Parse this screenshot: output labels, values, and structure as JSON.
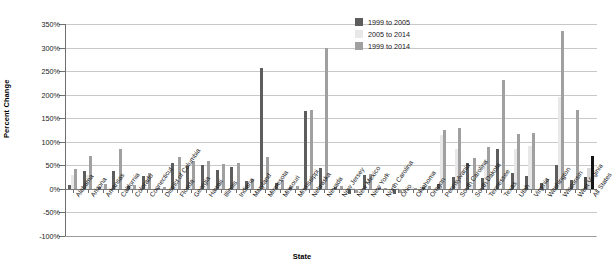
{
  "chart_data": {
    "type": "bar",
    "title": "",
    "xlabel": "State",
    "ylabel": "Percent Change",
    "ylim": [
      -100,
      350
    ],
    "ytick_step": 50,
    "ytick_labels": [
      "350%",
      "300%",
      "250%",
      "200%",
      "150%",
      "100%",
      "50%",
      "0%",
      "-50%",
      "-100%"
    ],
    "ytick_values": [
      350,
      300,
      250,
      200,
      150,
      100,
      50,
      0,
      -50,
      -100
    ],
    "grid": true,
    "legend_position": "top-right",
    "colors": {
      "series0": "#5d5d5d",
      "series1": "#e8e8e8",
      "series2": "#a0a0a0",
      "all_states_accent": "#151515"
    },
    "legend": [
      "1999 to 2005",
      "2005 to 2014",
      "1999 to 2014"
    ],
    "categories": [
      "Alabama",
      "Arizona",
      "Arkansas",
      "California",
      "Colorado",
      "Connecticut",
      "District of Columbia",
      "Florida",
      "Georgia",
      "Hawaii",
      "Illinois",
      "Indiana",
      "Maryland",
      "Minnesota",
      "Missouri",
      "Mississippi",
      "Nebraska",
      "Nevada",
      "New Jersey",
      "New Mexico",
      "New York",
      "North Carolina",
      "Ohio",
      "Oklahoma",
      "Oregon",
      "Pennsylvania",
      "South Carolina",
      "South Dakota",
      "Tennessee",
      "Texas",
      "Utah",
      "Virginia",
      "Washington",
      "Wisconsin",
      "West Virginia",
      "All States"
    ],
    "series": [
      {
        "name": "1999 to 2005",
        "values": [
          9,
          39,
          4,
          38,
          7,
          28,
          2,
          56,
          49,
          51,
          40,
          46,
          16,
          257,
          13,
          5,
          165,
          45,
          3,
          -10,
          30,
          1,
          -11,
          -3,
          4,
          11,
          26,
          56,
          23,
          85,
          33,
          27,
          12,
          50,
          19,
          25
        ]
      },
      {
        "name": "2005 to 2014",
        "values": [
          30,
          30,
          7,
          8,
          1,
          4,
          1,
          9,
          7,
          6,
          10,
          6,
          3,
          3,
          5,
          1,
          2,
          5,
          2,
          1,
          1,
          1,
          2,
          3,
          4,
          115,
          85,
          9,
          63,
          2,
          85,
          92,
          9,
          195,
          16,
          45
        ]
      },
      {
        "name": "1999 to 2014",
        "values": [
          42,
          69,
          11,
          84,
          8,
          33,
          3,
          68,
          59,
          60,
          52,
          55,
          20,
          68,
          19,
          6,
          167,
          300,
          7,
          -9,
          31,
          2,
          -9,
          1,
          7,
          126,
          130,
          66,
          88,
          232,
          117,
          119,
          22,
          335,
          168,
          70
        ]
      }
    ]
  }
}
